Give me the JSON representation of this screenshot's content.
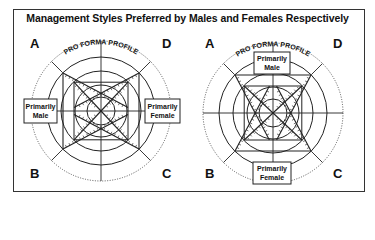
{
  "title": "Management Styles Preferred by Males and Females Respectively",
  "diagrams": [
    {
      "name": "left",
      "arc_label": "PRO FORMA PROFILE",
      "corners": {
        "a": "A",
        "b": "B",
        "c": "C",
        "d": "D"
      },
      "labels": {
        "male": [
          "Primarily",
          "Male"
        ],
        "female": [
          "Primarily",
          "Female"
        ]
      },
      "orientation": "horizontal"
    },
    {
      "name": "right",
      "arc_label": "PRO FORMA PROFILE",
      "corners": {
        "a": "A",
        "b": "B",
        "c": "C",
        "d": "D"
      },
      "labels": {
        "male": [
          "Primarily",
          "Male"
        ],
        "female": [
          "Primarily",
          "Female"
        ]
      },
      "orientation": "vertical"
    }
  ]
}
